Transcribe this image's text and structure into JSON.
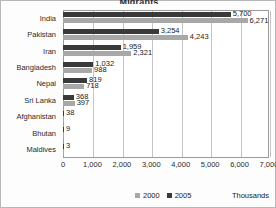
{
  "chart_data": {
    "type": "bar",
    "orientation": "horizontal",
    "title": "Migrants",
    "categories": [
      "India",
      "Pakistan",
      "Iran",
      "Bangladesh",
      "Nepal",
      "Sri Lanka",
      "Afghanistan",
      "Bhutan",
      "Maldives"
    ],
    "series": [
      {
        "name": "2005",
        "color": "#3a3a3a",
        "values": [
          5700,
          3254,
          1959,
          1032,
          819,
          368,
          38,
          9,
          3
        ]
      },
      {
        "name": "2000",
        "color": "#a8a8a8",
        "values": [
          6271,
          4243,
          2321,
          988,
          718,
          397,
          38,
          9,
          3
        ]
      }
    ],
    "value_labels": {
      "2005": [
        "5,700",
        "3,254",
        "1,959",
        "1,032",
        "819",
        "368",
        "38",
        "9",
        "3"
      ],
      "2000": [
        "6,271",
        "4,243",
        "2,321",
        "988",
        "718",
        "397",
        "",
        "",
        ""
      ]
    },
    "xlabel": "",
    "ylabel": "",
    "units": "Thousands",
    "xlim": [
      0,
      7000
    ],
    "xticks": [
      0,
      1000,
      2000,
      3000,
      4000,
      5000,
      6000,
      7000
    ],
    "xtick_labels": [
      "0",
      "1,000",
      "2,000",
      "3,000",
      "4,000",
      "5,000",
      "6,000",
      "7,000"
    ],
    "grid": true,
    "legend_position": "bottom-center",
    "legend_entries": [
      "2000",
      "2005"
    ]
  }
}
